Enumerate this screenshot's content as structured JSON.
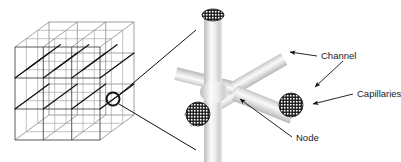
{
  "figure": {
    "background_color": "#ffffff",
    "ink_color": "#1a1a1a"
  },
  "labels": {
    "channel": "Channel",
    "capillaries": "Capillaries",
    "node": "Node"
  },
  "lattice": {
    "name": "cubic-lattice-block",
    "grid_divisions": 3,
    "line_color": "#6b6b6b",
    "accent_line_color": "#111111",
    "callout_circle": {
      "cx": 113,
      "cy": 99,
      "r": 6.5
    }
  },
  "detail": {
    "name": "node-detail",
    "cylinder_color": "#c9c9c9",
    "cylinder_highlight": "#f7f7f7",
    "capillary_count": 3,
    "arm_count": 6
  },
  "leader_lines": {
    "magnify_upper": {
      "x1": 119,
      "y1": 95,
      "x2": 196,
      "y2": 30
    },
    "magnify_lower": {
      "x1": 119,
      "y1": 104,
      "x2": 196,
      "y2": 150
    }
  },
  "arrows": [
    {
      "name": "channel-arrow-upper",
      "from_label": "Channel",
      "x1": 317,
      "y1": 56,
      "x2": 288,
      "y2": 52
    },
    {
      "name": "channel-arrow-lower",
      "from_label": "Channel",
      "x1": 343,
      "y1": 61,
      "x2": 313,
      "y2": 89
    },
    {
      "name": "capillaries-arrow",
      "from_label": "Capillaries",
      "x1": 353,
      "y1": 94,
      "x2": 311,
      "y2": 104
    },
    {
      "name": "node-arrow",
      "from_label": "Node",
      "x1": 292,
      "y1": 137,
      "x2": 238,
      "y2": 97
    }
  ]
}
